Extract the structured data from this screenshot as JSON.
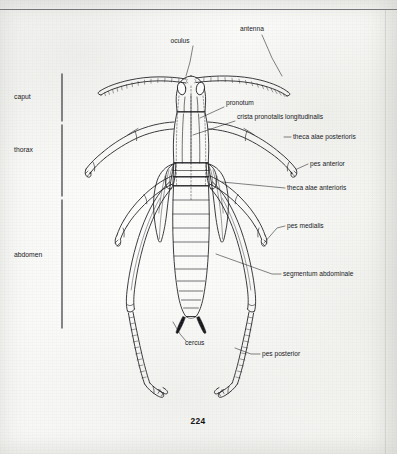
{
  "page": {
    "folio": "224",
    "rule_present": true,
    "background_hex": "#fbfbfa",
    "ink_hex": "#16171b"
  },
  "figure": {
    "view": "dorsal",
    "style": "line drawing"
  },
  "region_brackets": [
    {
      "label": "caput",
      "x": 14,
      "y": 99,
      "bracket_top": 72,
      "bracket_bottom": 123
    },
    {
      "label": "thorax",
      "x": 14,
      "y": 152,
      "bracket_top": 123,
      "bracket_bottom": 198
    },
    {
      "label": "abdomen",
      "x": 14,
      "y": 257,
      "bracket_top": 198,
      "bracket_bottom": 330
    }
  ],
  "callouts": [
    {
      "label": "oculus",
      "text_x": 180,
      "text_y": 43,
      "anchor": "middle",
      "leader": "M 193 46 L 190 62 L 186 76"
    },
    {
      "label": "antenna",
      "text_x": 240,
      "text_y": 31,
      "anchor": "start",
      "leader": "M 262 35 L 272 58 L 282 76"
    },
    {
      "label": "pronotum",
      "text_x": 226,
      "text_y": 105,
      "anchor": "start",
      "leader": "M 224 107 L 200 118"
    },
    {
      "label": "crista pronotalis longitudinalis",
      "text_x": 237,
      "text_y": 119,
      "anchor": "start",
      "leader": "M 235 121 L 193 135"
    },
    {
      "label": "theca alae posterioris",
      "text_x": 293,
      "text_y": 139,
      "anchor": "start",
      "leader": "M 291 137 L 284 137"
    },
    {
      "label": "pes anterior",
      "text_x": 310,
      "text_y": 166,
      "anchor": "start",
      "leader": "M 308 164 L 297 169"
    },
    {
      "label": "theca alae anterioris",
      "text_x": 287,
      "text_y": 190,
      "anchor": "start",
      "leader": "M 285 188 L 222 182"
    },
    {
      "label": "pes medialis",
      "text_x": 287,
      "text_y": 228,
      "anchor": "start",
      "leader": "M 285 226 L 277 228 L 264 243"
    },
    {
      "label": "segmentum abdominale",
      "text_x": 283,
      "text_y": 276,
      "anchor": "start",
      "leader": "M 281 274 L 272 274 L 216 254"
    },
    {
      "label": "cercus",
      "text_x": 185,
      "text_y": 345,
      "anchor": "start",
      "leader": "M 186 341 L 180 334 L 173 322"
    },
    {
      "label": "pes posterior",
      "text_x": 262,
      "text_y": 356,
      "anchor": "start",
      "leader": "M 260 354 L 251 354 L 235 348"
    }
  ]
}
